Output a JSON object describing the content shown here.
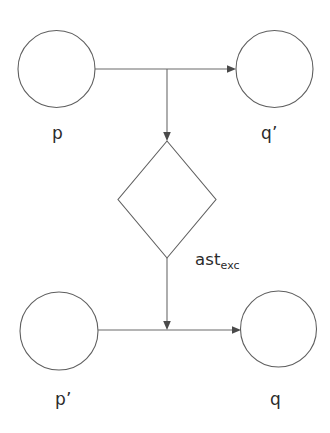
{
  "diagram": {
    "type": "state-transition-diagram",
    "background_color": "#ffffff",
    "stroke_color": "#5f5f5f",
    "text_color": "#2b2b2b",
    "nodes": [
      {
        "id": "p",
        "label": "p",
        "shape": "circle",
        "cx": 56.5,
        "cy": 69,
        "r": 38.5,
        "label_x": 52,
        "label_y": 125
      },
      {
        "id": "qp",
        "label": "q’",
        "shape": "circle",
        "cx": 274.5,
        "cy": 69,
        "r": 38.5,
        "label_x": 261,
        "label_y": 125
      },
      {
        "id": "pp",
        "label": "p’",
        "shape": "circle",
        "cx": 59,
        "cy": 331,
        "r": 39,
        "label_x": 55,
        "label_y": 391
      },
      {
        "id": "q",
        "label": "q",
        "shape": "circle",
        "cx": 278.5,
        "cy": 329,
        "r": 38,
        "label_x": 270,
        "label_y": 391
      }
    ],
    "diamond": {
      "id": "ast-exc-diamond",
      "shape": "diamond",
      "cx": 167,
      "cy": 199.5,
      "half_width": 49,
      "half_height": 58.5,
      "top": {
        "x": 167,
        "y": 141
      },
      "right": {
        "x": 216,
        "y": 199.5
      },
      "bottom": {
        "x": 167,
        "y": 258
      },
      "left": {
        "x": 118,
        "y": 199.5
      }
    },
    "edge_label": {
      "id": "ast-exc-label",
      "base": "ast",
      "subscript": "exc",
      "full_text": "ast_exc",
      "x": 195,
      "y": 252
    },
    "edges": [
      {
        "id": "p-to-qp",
        "from": "p",
        "to": "qp",
        "orientation": "horizontal",
        "y": 69,
        "x1": 95,
        "x2": 236,
        "arrowhead": true
      },
      {
        "id": "junction-down",
        "from": "p-to-qp-junction",
        "to": "diamond-top",
        "orientation": "vertical",
        "x": 167,
        "y1": 69,
        "y2": 141,
        "arrowhead": true
      },
      {
        "id": "diamond-down",
        "from": "diamond-bottom",
        "to": "pp-to-q",
        "orientation": "vertical",
        "x": 167,
        "y1": 258,
        "y2": 330,
        "arrowhead": true
      },
      {
        "id": "pp-to-q",
        "from": "pp",
        "to": "q",
        "orientation": "horizontal",
        "y": 330,
        "x1": 98,
        "x2": 241,
        "arrowhead": true
      }
    ]
  }
}
